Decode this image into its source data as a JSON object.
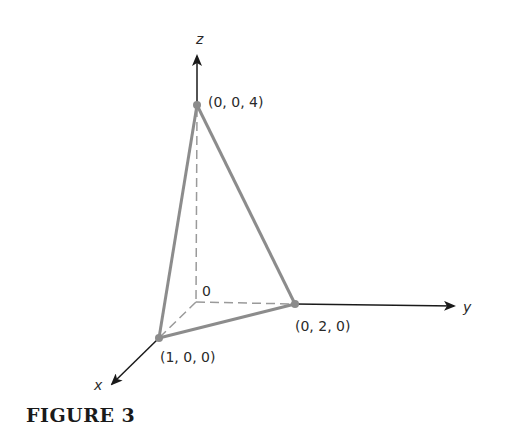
{
  "figure": {
    "caption": "FIGURE 3",
    "axes": {
      "x_label": "x",
      "y_label": "y",
      "z_label": "z",
      "origin_label": "0"
    },
    "points": [
      {
        "label": "(0, 0, 4)",
        "coords": [
          0,
          0,
          4
        ]
      },
      {
        "label": "(0, 2, 0)",
        "coords": [
          0,
          2,
          0
        ]
      },
      {
        "label": "(1, 0, 0)",
        "coords": [
          1,
          0,
          0
        ]
      }
    ],
    "colors": {
      "axis": "#1a1a1a",
      "edge": "#8c8c8c",
      "hidden_edge": "#9a9a9a"
    }
  }
}
